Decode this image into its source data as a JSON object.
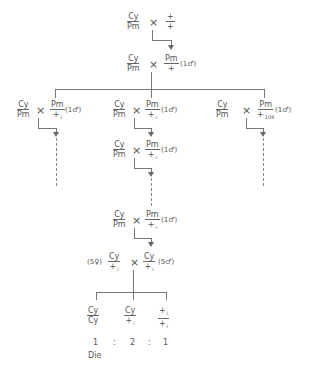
{
  "cross1": {
    "female": {
      "num": "Cy",
      "den": "Pm"
    },
    "times": "×",
    "male": {
      "num": "+",
      "den": "+"
    }
  },
  "cross2": {
    "female": {
      "num": "Cy",
      "den": "Pm"
    },
    "times": "×",
    "male": {
      "num": "Pm",
      "den": "+"
    },
    "note": "(1♂)"
  },
  "branches": [
    {
      "female": {
        "num": "Cy",
        "den": "Pm"
      },
      "times": "×",
      "male": {
        "num": "Pm",
        "den": "+",
        "den_sub": "i"
      },
      "note": "(1♂)"
    },
    {
      "female": {
        "num": "Cy",
        "den": "Pm"
      },
      "times": "×",
      "male": {
        "num": "Pm",
        "den": "+",
        "den_sub": "i"
      },
      "note": "(1♂)"
    },
    {
      "female": {
        "num": "Cy",
        "den": "Pm"
      },
      "times": "×",
      "male": {
        "num": "Pm",
        "den": "+",
        "den_sub": "104"
      },
      "note": "(1♂)"
    }
  ],
  "cross3": {
    "female": {
      "num": "Cy",
      "den": "Pm"
    },
    "times": "×",
    "male": {
      "num": "Pm",
      "den": "+",
      "den_sub": "i"
    },
    "note": "(1♂)"
  },
  "cross4": {
    "female": {
      "num": "Cy",
      "den": "Pm"
    },
    "times": "×",
    "male": {
      "num": "Pm",
      "den": "+",
      "den_sub": "i"
    },
    "note": "(1♂)"
  },
  "cross5": {
    "female_note": "(5♀)",
    "female": {
      "num": "Cy",
      "den": "+",
      "den_sub": "i"
    },
    "times": "×",
    "male": {
      "num": "Cy",
      "den": "+",
      "den_sub": "i"
    },
    "male_note": "(5♂)"
  },
  "progeny": [
    {
      "num": "Cy",
      "den": "Cy",
      "ratio": "1",
      "fate": "Die"
    },
    {
      "num": "Cy",
      "den": "+",
      "den_sub": "i",
      "ratio": "2"
    },
    {
      "num": "+",
      "num_sub": "i",
      "den": "+",
      "den_sub": "i",
      "ratio": "1"
    }
  ],
  "ratio_sep": ":"
}
